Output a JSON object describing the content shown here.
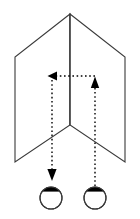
{
  "figure": {
    "canvas": {
      "width": 140,
      "height": 219,
      "background": "#ffffff"
    },
    "stroke_color": "#3a3a3a",
    "ray_color": "#000000",
    "fill_color": "#000000"
  },
  "panels": {
    "name": "hinged-panel-pair",
    "description": "Two rectangular panels joined at a vertical center hinge, drawn in perspective forming a shallow V opening toward the viewer",
    "hinge": {
      "x": 70,
      "top_y": 14,
      "bottom_y": 125
    },
    "left_panel": {
      "label": "left-panel",
      "points": "70,14 15,57 15,162 70,125"
    },
    "right_panel": {
      "label": "right-panel",
      "points": "70,14 125,57 125,162 70,125"
    }
  },
  "rays": {
    "description": "Dotted ray path: up from right eye, left along the horizontal segment, then down to left eye",
    "dash_pattern": "1.6,2.6",
    "stroke_width": 1.4,
    "segments": [
      {
        "name": "right-vertical-ray",
        "from": {
          "x": 95,
          "y": 186
        },
        "to": {
          "x": 95,
          "y": 78
        },
        "direction": "up"
      },
      {
        "name": "horizontal-ray",
        "from": {
          "x": 95,
          "y": 76
        },
        "to": {
          "x": 56,
          "y": 76
        },
        "direction": "left"
      },
      {
        "name": "left-vertical-ray",
        "from": {
          "x": 52,
          "y": 80
        },
        "to": {
          "x": 52,
          "y": 170
        },
        "direction": "down"
      }
    ],
    "arrowheads": [
      {
        "name": "arrowhead-left",
        "x": 50,
        "y": 76,
        "direction": "left"
      },
      {
        "name": "arrowhead-up",
        "x": 95,
        "y": 78,
        "direction": "up"
      },
      {
        "name": "arrowhead-down",
        "x": 52,
        "y": 179,
        "direction": "down"
      }
    ]
  },
  "eyes": [
    {
      "name": "eye-left",
      "cx": 51,
      "cy": 198,
      "r": 11,
      "pupil_cap": "filled black arc across the top of the circle"
    },
    {
      "name": "eye-right",
      "cx": 95,
      "cy": 198,
      "r": 11,
      "pupil_cap": "filled black arc across the top of the circle"
    }
  ]
}
